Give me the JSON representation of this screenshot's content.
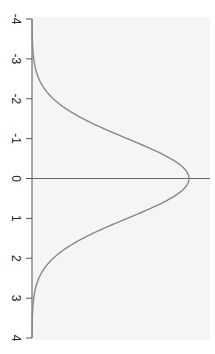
{
  "chart_data": {
    "type": "line",
    "title": "",
    "orientation": "rotated-90",
    "xlabel": "",
    "ylabel": "",
    "xlim": [
      -4,
      4
    ],
    "ticks": [
      "-4",
      "-3",
      "-2",
      "-1",
      "0",
      "1",
      "2",
      "3",
      "4"
    ],
    "tick_values": [
      -4,
      -3,
      -2,
      -1,
      0,
      1,
      2,
      3,
      4
    ],
    "series": [
      {
        "name": "standard normal density",
        "x": [
          -4,
          -3.5,
          -3,
          -2.5,
          -2,
          -1.5,
          -1,
          -0.5,
          0,
          0.5,
          1,
          1.5,
          2,
          2.5,
          3,
          3.5,
          4
        ],
        "values": [
          0.0001,
          0.0009,
          0.0044,
          0.0175,
          0.054,
          0.1295,
          0.242,
          0.3521,
          0.3989,
          0.3521,
          0.242,
          0.1295,
          0.054,
          0.0175,
          0.0044,
          0.0009,
          0.0001
        ]
      }
    ],
    "reference_line": {
      "at": 0,
      "orientation": "perpendicular-to-axis"
    },
    "grid": false,
    "legend": null,
    "plot_background": "#f5f5f5",
    "line_color": "#888888",
    "axis_color": "#555555"
  }
}
